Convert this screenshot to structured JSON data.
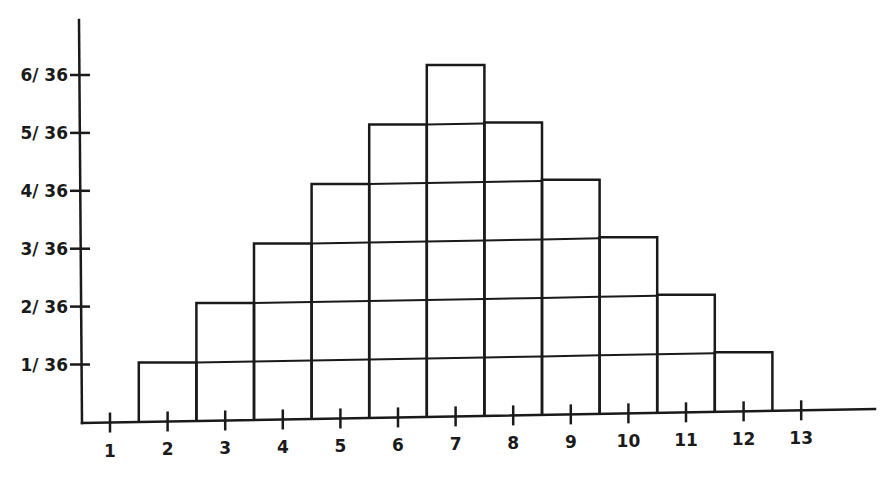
{
  "chart_data": {
    "type": "bar",
    "title": "",
    "xlabel": "",
    "ylabel": "",
    "categories": [
      "1",
      "2",
      "3",
      "4",
      "5",
      "6",
      "7",
      "8",
      "9",
      "10",
      "11",
      "12",
      "13"
    ],
    "values": [
      0,
      0.02778,
      0.05556,
      0.08333,
      0.11111,
      0.13889,
      0.16667,
      0.13889,
      0.11111,
      0.08333,
      0.05556,
      0.02778,
      0
    ],
    "values_fraction": [
      "0",
      "1/36",
      "2/36",
      "3/36",
      "4/36",
      "5/36",
      "6/36",
      "5/36",
      "4/36",
      "3/36",
      "2/36",
      "1/36",
      "0"
    ],
    "units_of_36": [
      0,
      1,
      2,
      3,
      4,
      5,
      6,
      5,
      4,
      3,
      2,
      1,
      0
    ],
    "y_tick_labels": [
      "1/ 36",
      "2/ 36",
      "3/ 36",
      "4/ 36",
      "5/ 36",
      "6/ 36"
    ],
    "x_tick_labels": [
      "1",
      "2",
      "3",
      "4",
      "5",
      "6",
      "7",
      "8",
      "9",
      "10",
      "11",
      "12",
      "13"
    ],
    "ylim": [
      0,
      0.1944
    ],
    "grid": false,
    "legend": null,
    "style": "histogram with stacked unit cells, hand-drawn black lines",
    "colors": {
      "line": "#1a1a1a",
      "background": "#ffffff"
    }
  }
}
